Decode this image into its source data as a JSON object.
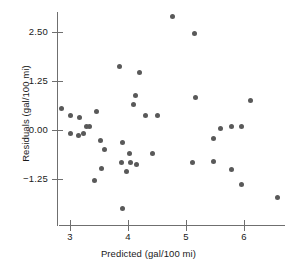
{
  "chart_data": {
    "type": "scatter",
    "title": "",
    "xlabel": "Predicted (gal/100 mi)",
    "ylabel": "Residuals (gal/100 mi)",
    "xlim": [
      2.65,
      6.75
    ],
    "ylim": [
      -2.05,
      3.1
    ],
    "grid": false,
    "legend": null,
    "xticks": [
      3,
      4,
      5,
      6
    ],
    "xtick_labels": [
      "3",
      "4",
      "5",
      "6"
    ],
    "yticks": [
      2.5,
      1.25,
      0.0,
      -1.25
    ],
    "ytick_labels": [
      "2.50",
      "1.25",
      "0.00",
      "-1.25"
    ],
    "marker_color": "#595959",
    "axis_color": "#6f6f6f",
    "points": [
      {
        "x": 2.86,
        "y": 0.54
      },
      {
        "x": 3.0,
        "y": 0.36
      },
      {
        "x": 3.14,
        "y": -0.13
      },
      {
        "x": 3.0,
        "y": -0.08
      },
      {
        "x": 3.16,
        "y": 0.31
      },
      {
        "x": 3.29,
        "y": 0.1
      },
      {
        "x": 3.24,
        "y": -0.08
      },
      {
        "x": 3.45,
        "y": 0.46
      },
      {
        "x": 3.52,
        "y": -0.26
      },
      {
        "x": 3.6,
        "y": -0.51
      },
      {
        "x": 3.55,
        "y": -0.97
      },
      {
        "x": 3.43,
        "y": -1.3
      },
      {
        "x": 3.86,
        "y": 1.62
      },
      {
        "x": 3.9,
        "y": -0.32
      },
      {
        "x": 3.88,
        "y": -0.82
      },
      {
        "x": 3.98,
        "y": -1.06
      },
      {
        "x": 4.05,
        "y": -0.84
      },
      {
        "x": 4.14,
        "y": -0.87
      },
      {
        "x": 3.91,
        "y": -2.01
      },
      {
        "x": 4.19,
        "y": 1.46
      },
      {
        "x": 4.13,
        "y": 0.87
      },
      {
        "x": 4.09,
        "y": 0.64
      },
      {
        "x": 4.31,
        "y": 0.36
      },
      {
        "x": 4.5,
        "y": 0.36
      },
      {
        "x": 4.76,
        "y": 2.9
      },
      {
        "x": 5.14,
        "y": 2.47
      },
      {
        "x": 5.16,
        "y": 0.82
      },
      {
        "x": 5.12,
        "y": -0.82
      },
      {
        "x": 5.47,
        "y": -0.21
      },
      {
        "x": 5.47,
        "y": -0.8
      },
      {
        "x": 5.6,
        "y": 0.05
      },
      {
        "x": 5.78,
        "y": 0.1
      },
      {
        "x": 5.95,
        "y": 0.1
      },
      {
        "x": 5.78,
        "y": -1.0
      },
      {
        "x": 6.12,
        "y": 0.74
      },
      {
        "x": 5.95,
        "y": -1.38
      },
      {
        "x": 6.57,
        "y": -1.71
      },
      {
        "x": 4.43,
        "y": -0.6
      },
      {
        "x": 4.02,
        "y": -0.59
      },
      {
        "x": 3.33,
        "y": 0.08
      }
    ]
  }
}
